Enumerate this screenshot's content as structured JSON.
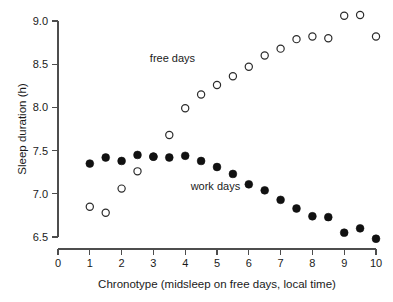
{
  "chart_data": {
    "type": "scatter",
    "title": "",
    "xlabel": "Chronotype (midsleep on free days, local time)",
    "ylabel": "Sleep duration (h)",
    "xlim": [
      0,
      10
    ],
    "ylim": [
      6.5,
      9.0
    ],
    "xticks": [
      "0",
      "1",
      "2",
      "3",
      "4",
      "5",
      "6",
      "7",
      "8",
      "9",
      "10"
    ],
    "xtick_values": [
      0,
      1,
      2,
      3,
      4,
      5,
      6,
      7,
      8,
      9,
      10
    ],
    "yticks": [
      "6.5",
      "7.0",
      "7.5",
      "8.0",
      "8.5",
      "9.0"
    ],
    "ytick_values": [
      6.5,
      7.0,
      7.5,
      8.0,
      8.5,
      9.0
    ],
    "grid": false,
    "legend_position": "inline-annotations",
    "annotations": [
      {
        "text": "free days",
        "x": 3.6,
        "y": 8.52
      },
      {
        "text": "work days",
        "x": 4.95,
        "y": 7.04
      }
    ],
    "series": [
      {
        "name": "free days",
        "marker": "open-circle",
        "color": "#2b2b2b",
        "x": [
          1.0,
          1.5,
          2.0,
          2.5,
          3.0,
          3.5,
          4.0,
          4.5,
          5.0,
          5.5,
          6.0,
          6.5,
          7.0,
          7.5,
          8.0,
          8.5,
          9.0,
          9.5,
          10.0
        ],
        "values": [
          6.85,
          6.78,
          7.06,
          7.26,
          7.43,
          7.68,
          7.99,
          8.15,
          8.26,
          8.36,
          8.47,
          8.6,
          8.68,
          8.79,
          8.82,
          8.8,
          9.06,
          9.07,
          8.82
        ]
      },
      {
        "name": "work days",
        "marker": "filled-circle",
        "color": "#111111",
        "x": [
          1.0,
          1.5,
          2.0,
          2.5,
          3.0,
          3.5,
          4.0,
          4.5,
          5.0,
          5.5,
          6.0,
          6.5,
          7.0,
          7.5,
          8.0,
          8.5,
          9.0,
          9.5,
          10.0
        ],
        "values": [
          7.35,
          7.42,
          7.38,
          7.45,
          7.43,
          7.42,
          7.44,
          7.38,
          7.31,
          7.23,
          7.11,
          7.04,
          6.93,
          6.83,
          6.74,
          6.73,
          6.55,
          6.6,
          6.48
        ]
      }
    ]
  },
  "axes": {
    "y_title": "Sleep duration (h)",
    "x_title": "Chronotype (midsleep on free days, local time)"
  },
  "labels": {
    "free_days": "free days",
    "work_days": "work days"
  }
}
